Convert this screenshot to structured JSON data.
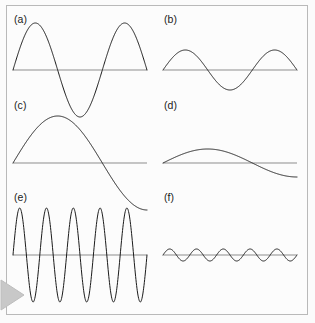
{
  "figure": {
    "background_color": "#fcfcfc",
    "border_color": "#b9b9b9",
    "axis_color": "#8d8d8d",
    "curve_color": "#1b1b1b",
    "marker_color": "#c8c8c8",
    "marker_name": "page-flip-triangle"
  },
  "chart_data": {
    "type": "line",
    "xlabel": "",
    "ylabel": "",
    "grid": false,
    "legend_position": "none",
    "layout": {
      "rows": 3,
      "cols": 2
    },
    "shared_x_range": [
      0,
      1
    ],
    "panels": [
      {
        "label": "(a)",
        "row": 1,
        "col": 1,
        "waveform": "sine",
        "amplitude": 1.0,
        "cycles": 1.5,
        "phase": 0,
        "amplitude_class": "large",
        "frequency_class": "medium",
        "axis_x_start": 13,
        "axis_x_end": 147,
        "axis_y": 70,
        "pixel_amplitude": 47,
        "label_x": 14,
        "label_y": 14
      },
      {
        "label": "(b)",
        "row": 1,
        "col": 2,
        "waveform": "sine",
        "amplitude": 0.42,
        "cycles": 1.5,
        "phase": 0,
        "amplitude_class": "small",
        "frequency_class": "medium",
        "axis_x_start": 163,
        "axis_x_end": 297,
        "axis_y": 70,
        "pixel_amplitude": 20,
        "label_x": 164,
        "label_y": 14
      },
      {
        "label": "(c)",
        "row": 2,
        "col": 1,
        "waveform": "sine",
        "amplitude": 1.0,
        "cycles": 0.75,
        "phase": 0,
        "amplitude_class": "large",
        "frequency_class": "low",
        "axis_x_start": 13,
        "axis_x_end": 147,
        "axis_y": 163,
        "pixel_amplitude": 47,
        "label_x": 14,
        "label_y": 100
      },
      {
        "label": "(d)",
        "row": 2,
        "col": 2,
        "waveform": "sine",
        "amplitude": 0.3,
        "cycles": 0.75,
        "phase": 0,
        "amplitude_class": "small",
        "frequency_class": "low",
        "axis_x_start": 163,
        "axis_x_end": 297,
        "axis_y": 163,
        "pixel_amplitude": 14,
        "label_x": 164,
        "label_y": 100
      },
      {
        "label": "(e)",
        "row": 3,
        "col": 1,
        "waveform": "sine",
        "amplitude": 1.0,
        "cycles": 5,
        "phase": 0,
        "amplitude_class": "large",
        "frequency_class": "high",
        "axis_x_start": 13,
        "axis_x_end": 147,
        "axis_y": 255,
        "pixel_amplitude": 47,
        "label_x": 14,
        "label_y": 192
      },
      {
        "label": "(f)",
        "row": 3,
        "col": 2,
        "waveform": "sine",
        "amplitude": 0.13,
        "cycles": 5,
        "phase": 0,
        "amplitude_class": "small",
        "frequency_class": "high",
        "axis_x_start": 163,
        "axis_x_end": 297,
        "axis_y": 255,
        "pixel_amplitude": 6,
        "label_x": 164,
        "label_y": 192
      }
    ]
  }
}
